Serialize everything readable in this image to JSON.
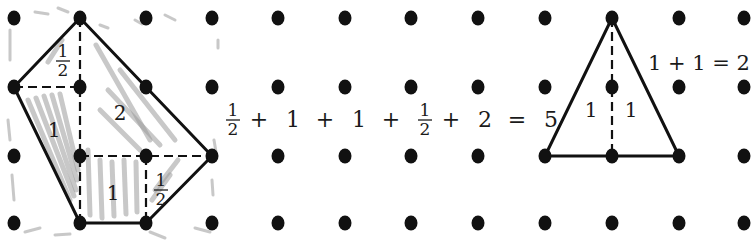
{
  "figure": {
    "grid": {
      "columns": 12,
      "rows": 4,
      "dot_color": "#111111"
    },
    "left_shape": {
      "vertices_grid": [
        [
          1,
          0
        ],
        [
          0,
          1
        ],
        [
          1,
          3
        ],
        [
          2,
          3
        ],
        [
          3,
          2
        ],
        [
          2,
          1
        ]
      ],
      "dashed_segments_grid": [
        [
          [
            1,
            0
          ],
          [
            1,
            3
          ]
        ],
        [
          [
            0,
            1
          ],
          [
            1,
            1
          ]
        ],
        [
          [
            1,
            2
          ],
          [
            3,
            2
          ]
        ],
        [
          [
            2,
            2
          ],
          [
            2,
            3
          ]
        ]
      ],
      "pieces": [
        {
          "label_num": "1",
          "label_den": "2",
          "is_fraction": true,
          "region": "top-left triangle"
        },
        {
          "label": "2",
          "region": "right trapezoid"
        },
        {
          "label": "1",
          "region": "left triangle"
        },
        {
          "label": "1",
          "region": "bottom square"
        },
        {
          "label_num": "1",
          "label_den": "2",
          "is_fraction": true,
          "region": "bottom-right triangle"
        }
      ],
      "shading_color": "#9a9a9a"
    },
    "left_equation": {
      "terms": [
        {
          "num": "1",
          "den": "2"
        },
        {
          "op": "+"
        },
        {
          "val": "1"
        },
        {
          "op": "+"
        },
        {
          "val": "1"
        },
        {
          "op": "+"
        },
        {
          "num": "1",
          "den": "2"
        },
        {
          "op": "+"
        },
        {
          "val": "2"
        },
        {
          "op": "="
        },
        {
          "val": "5"
        }
      ],
      "text": "1/2 + 1 + 1 + 1/2 + 2 = 5"
    },
    "right_shape": {
      "vertices_grid": [
        [
          9,
          0
        ],
        [
          8,
          2
        ],
        [
          10,
          2
        ]
      ],
      "dashed_segments_grid": [
        [
          [
            9,
            0
          ],
          [
            9,
            2
          ]
        ]
      ],
      "pieces": [
        {
          "label": "1",
          "region": "left half"
        },
        {
          "label": "1",
          "region": "right half"
        }
      ]
    },
    "right_equation": {
      "text": "1 + 1 = 2"
    }
  }
}
